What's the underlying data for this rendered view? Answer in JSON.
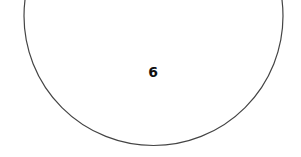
{
  "diagram": {
    "shape": "circle",
    "label": "6",
    "stroke_color": "#444444",
    "fill_color": "#ffffff",
    "text_color": "#111111"
  }
}
